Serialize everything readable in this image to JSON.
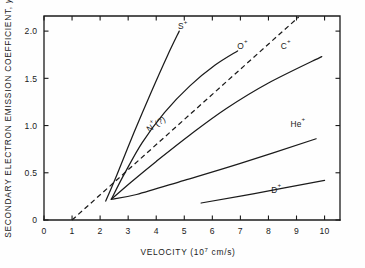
{
  "chart_data": {
    "type": "line",
    "title": "",
    "xlabel": "VELOCITY (10⁷ cm/s)",
    "xlabel_main": "VELOCITY (10",
    "xlabel_exp": "7",
    "xlabel_tail": " cm/s)",
    "ylabel": "SECONDARY ELECTRON EMISSION COEFFICIENT, γ",
    "ylabel_main": "SECONDARY ELECTRON EMISSION COEFFICIENT, ",
    "ylabel_symbol": "γ",
    "xlim": [
      0,
      10.55
    ],
    "ylim": [
      0,
      2.16
    ],
    "grid": false,
    "legend": "inline-labels",
    "xticks": [
      0,
      1,
      2,
      3,
      4,
      5,
      6,
      7,
      8,
      9,
      10
    ],
    "xtick_labels": [
      "0",
      "1",
      "2",
      "3",
      "4",
      "5",
      "6",
      "7",
      "8",
      "9",
      "10"
    ],
    "yticks": [
      0,
      0.5,
      1.0,
      1.5,
      2.0
    ],
    "ytick_labels": [
      "0",
      "0.5",
      "1.0",
      "1.5",
      "2.0"
    ],
    "series": [
      {
        "name": "S+",
        "label_main": "S",
        "label_sup": "+",
        "style": "solid",
        "label_x": 4.95,
        "label_y": 2.02,
        "points": [
          [
            2.2,
            0.2
          ],
          [
            2.6,
            0.48
          ],
          [
            3.2,
            0.92
          ],
          [
            3.8,
            1.34
          ],
          [
            4.4,
            1.74
          ],
          [
            4.82,
            2.0
          ]
        ]
      },
      {
        "name": "O+",
        "label_main": "O",
        "label_sup": "+",
        "style": "solid",
        "label_x": 7.08,
        "label_y": 1.81,
        "points": [
          [
            2.4,
            0.22
          ],
          [
            2.85,
            0.48
          ],
          [
            3.5,
            0.82
          ],
          [
            4.3,
            1.14
          ],
          [
            5.2,
            1.42
          ],
          [
            6.1,
            1.64
          ],
          [
            6.9,
            1.79
          ]
        ]
      },
      {
        "name": "C+",
        "label_main": "C",
        "label_sup": "+",
        "style": "solid",
        "label_x": 8.62,
        "label_y": 1.81,
        "points": [
          [
            2.4,
            0.22
          ],
          [
            3.1,
            0.4
          ],
          [
            4.0,
            0.62
          ],
          [
            5.2,
            0.9
          ],
          [
            6.5,
            1.18
          ],
          [
            8.0,
            1.45
          ],
          [
            9.9,
            1.73
          ]
        ]
      },
      {
        "name": "N+(?)",
        "label_main": "N",
        "label_sup": "+",
        "label_tail": "(?)",
        "style": "dashed",
        "label_x": 4.05,
        "label_y": 0.99,
        "label_rotation": -34,
        "points": [
          [
            1.0,
            0.0
          ],
          [
            9.08,
            2.15
          ]
        ]
      },
      {
        "name": "He+",
        "label_main": "He",
        "label_sup": "+",
        "style": "solid",
        "label_x": 9.05,
        "label_y": 0.99,
        "points": [
          [
            2.4,
            0.22
          ],
          [
            3.3,
            0.27
          ],
          [
            5.0,
            0.42
          ],
          [
            7.0,
            0.6
          ],
          [
            9.7,
            0.86
          ]
        ]
      },
      {
        "name": "D+",
        "label_main": "D",
        "label_sup": "+",
        "style": "solid",
        "label_x": 8.28,
        "label_y": 0.29,
        "points": [
          [
            5.6,
            0.18
          ],
          [
            7.5,
            0.28
          ],
          [
            10.0,
            0.42
          ]
        ]
      }
    ]
  }
}
